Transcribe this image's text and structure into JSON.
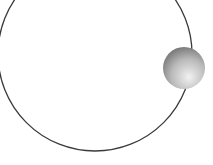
{
  "diagram": {
    "type": "orbit",
    "background": "#ffffff",
    "orbit": {
      "cx": 95,
      "cy": 54,
      "r": 97,
      "stroke": "#3a3a3a",
      "stroke_width": 1.3
    },
    "body": {
      "cx": 184,
      "cy": 68,
      "r": 21,
      "highlight": "#f2f2f2",
      "mid": "#b9b9b9",
      "shadow": "#6e6e6e"
    }
  }
}
